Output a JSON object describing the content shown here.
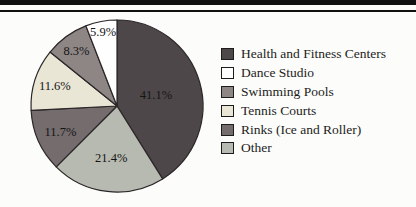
{
  "page": {
    "background": "#fcfcfa",
    "rule_color": "#101010"
  },
  "chart_data": {
    "type": "pie",
    "title": "",
    "legend_position": "right",
    "slices": [
      {
        "label": "Health and Fitness Centers",
        "value": 41.1,
        "pct_label": "41.1%",
        "color": "#4e4749",
        "label_r": 0.47
      },
      {
        "label": "Dance Studio",
        "value": 5.9,
        "pct_label": "5.9%",
        "color": "#fefefe",
        "label_r": 0.88
      },
      {
        "label": "Swimming Pools",
        "value": 8.3,
        "pct_label": "8.3%",
        "color": "#8e8585",
        "label_r": 0.8
      },
      {
        "label": "Tennis Courts",
        "value": 11.6,
        "pct_label": "11.6%",
        "color": "#e9e6d6",
        "label_r": 0.76
      },
      {
        "label": "Rinks (Ice and Roller)",
        "value": 11.7,
        "pct_label": "11.7%",
        "color": "#746c6d",
        "label_r": 0.72
      },
      {
        "label": "Other",
        "value": 21.4,
        "pct_label": "21.4%",
        "color": "#b7bab0",
        "label_r": 0.6
      }
    ],
    "clockwise_order": [
      0,
      5,
      4,
      3,
      2,
      1
    ],
    "start_angle_deg": 0,
    "stroke_color": "#2b2628"
  }
}
